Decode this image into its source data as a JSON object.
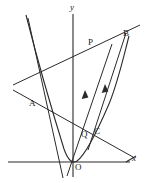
{
  "figure": {
    "kind": "coordinate-geometry-diagram",
    "background_color": "#ffffff",
    "stroke_color": "#2a2a2a",
    "label_color": "#1a1a1a",
    "width": 147,
    "height": 183
  },
  "axes": {
    "x_label": "x",
    "y_label": "y",
    "origin_label": "O",
    "x_axis": {
      "x1": 8,
      "y1": 162,
      "x2": 130,
      "y2": 162
    },
    "y_axis": {
      "x1": 73,
      "y1": 14,
      "x2": 73,
      "y2": 177
    },
    "origin": {
      "x": 73,
      "y": 162
    }
  },
  "points": [
    {
      "name": "A",
      "label": "A",
      "x": 40,
      "y": 105,
      "label_x": 30,
      "label_y": 100
    },
    {
      "name": "P",
      "label": "P",
      "x": 99,
      "y": 50,
      "label_x": 89,
      "label_y": 40
    },
    {
      "name": "B",
      "label": "B",
      "x": 120,
      "y": 38,
      "label_x": 124,
      "label_y": 32
    },
    {
      "name": "Q",
      "label": "Q",
      "x": 89,
      "y": 137,
      "label_x": 82,
      "label_y": 132
    },
    {
      "name": "C",
      "label": "C",
      "x": 97,
      "y": 136,
      "label_x": 95,
      "label_y": 129
    },
    {
      "name": "O",
      "label": "O",
      "x": 73,
      "y": 162,
      "label_x": 76,
      "label_y": 164
    }
  ],
  "curves": [
    {
      "name": "parabola",
      "description": "upward parabola with vertex left of origin passing through O, A, B, C",
      "path": "M 26,15 C 38,62 55,120 64,149 C 68,160 72,164 77,161 C 84,156 96,134 109,104 C 118,82 124,55 129,36"
    }
  ],
  "lines": [
    {
      "name": "line-AB",
      "description": "secant line through A and B (shallow positive slope)",
      "x1": 13,
      "y1": 85,
      "x2": 140,
      "y2": 25
    },
    {
      "name": "line-A-through-origin-right",
      "description": "descending line through A crossing x-axis to the right",
      "x1": 13,
      "y1": 90,
      "x2": 133,
      "y2": 157
    },
    {
      "name": "line-steep-left",
      "description": "steep line from upper-left down through A to lower-left of origin",
      "x1": 28,
      "y1": 18,
      "x2": 63,
      "y2": 178
    },
    {
      "name": "line-OP",
      "description": "ray from origin through Q and P with parallel arrow marker",
      "x1": 67,
      "y1": 176,
      "x2": 112,
      "y2": 44
    },
    {
      "name": "line-CB",
      "description": "ray from C through B with parallel arrow marker",
      "x1": 88,
      "y1": 150,
      "x2": 126,
      "y2": 33
    }
  ],
  "markers": [
    {
      "name": "parallel-arrow-1",
      "on": "line-OP",
      "x": 85,
      "y": 98,
      "angle": -71
    },
    {
      "name": "parallel-arrow-2",
      "on": "line-CB",
      "x": 105,
      "y": 92,
      "angle": -72
    }
  ]
}
